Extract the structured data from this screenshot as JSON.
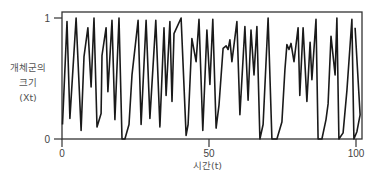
{
  "chart_data": {
    "type": "line",
    "title": "",
    "xlabel": "시간(t)",
    "ylabel": "개체군의 크기 (Xt)",
    "ylabel_lines": [
      "개체군의",
      "크기",
      "(Xt)"
    ],
    "xlim": [
      0,
      100
    ],
    "ylim": [
      0,
      1
    ],
    "x_ticks": [
      0,
      50,
      100
    ],
    "y_ticks": [
      0,
      1
    ],
    "grid": false,
    "legend": null,
    "series": [
      {
        "name": "Xt",
        "color": "#1a1a1a",
        "points": [
          [
            0,
            0.12
          ],
          [
            1.7,
            0.97
          ],
          [
            2.7,
            0.17
          ],
          [
            4.8,
            1.0
          ],
          [
            6.5,
            0.07
          ],
          [
            7.5,
            0.68
          ],
          [
            8.8,
            0.92
          ],
          [
            9.9,
            0.43
          ],
          [
            10.9,
            1.0
          ],
          [
            11.9,
            0.1
          ],
          [
            13.3,
            0.21
          ],
          [
            13.6,
            0.69
          ],
          [
            15.0,
            0.92
          ],
          [
            15.6,
            0.39
          ],
          [
            17.0,
            0.98
          ],
          [
            18.0,
            0.16
          ],
          [
            19.4,
            1.0
          ],
          [
            20.4,
            0.0
          ],
          [
            21.4,
            0.0
          ],
          [
            22.8,
            0.12
          ],
          [
            23.8,
            0.53
          ],
          [
            25.9,
            0.98
          ],
          [
            26.9,
            0.12
          ],
          [
            28.6,
            0.98
          ],
          [
            29.9,
            0.17
          ],
          [
            31.9,
            0.98
          ],
          [
            33.3,
            0.1
          ],
          [
            34.7,
            0.92
          ],
          [
            35.4,
            0.36
          ],
          [
            36.7,
            0.97
          ],
          [
            37.4,
            0.31
          ],
          [
            38.1,
            0.87
          ],
          [
            40.5,
            1.0
          ],
          [
            42.2,
            0.03
          ],
          [
            42.9,
            0.12
          ],
          [
            44.2,
            0.83
          ],
          [
            45.6,
            0.64
          ],
          [
            46.6,
            0.99
          ],
          [
            47.9,
            0.07
          ],
          [
            49.3,
            0.9
          ],
          [
            50.3,
            0.45
          ],
          [
            51.3,
            0.99
          ],
          [
            52.4,
            0.09
          ],
          [
            53.4,
            0.28
          ],
          [
            54.8,
            0.75
          ],
          [
            55.8,
            0.77
          ],
          [
            56.5,
            0.74
          ],
          [
            57.1,
            0.82
          ],
          [
            57.8,
            0.64
          ],
          [
            59.5,
            0.97
          ],
          [
            60.5,
            0.2
          ],
          [
            62.2,
            0.93
          ],
          [
            63.3,
            0.32
          ],
          [
            64.3,
            0.9
          ],
          [
            65.3,
            0.53
          ],
          [
            66.3,
            0.93
          ],
          [
            67.3,
            0.0
          ],
          [
            68.4,
            0.12
          ],
          [
            70.1,
            1.0
          ],
          [
            71.4,
            0.0
          ],
          [
            73.1,
            0.0
          ],
          [
            74.8,
            0.14
          ],
          [
            75.8,
            0.57
          ],
          [
            76.5,
            0.78
          ],
          [
            77.2,
            0.74
          ],
          [
            77.9,
            0.79
          ],
          [
            78.9,
            0.64
          ],
          [
            80.3,
            0.92
          ],
          [
            80.9,
            0.36
          ],
          [
            82.0,
            0.92
          ],
          [
            83.3,
            0.31
          ],
          [
            84.4,
            0.8
          ],
          [
            85.0,
            0.49
          ],
          [
            86.4,
            0.99
          ],
          [
            87.1,
            0.0
          ],
          [
            88.4,
            0.0
          ],
          [
            89.8,
            0.16
          ],
          [
            90.5,
            0.29
          ],
          [
            91.5,
            0.85
          ],
          [
            92.9,
            0.53
          ],
          [
            93.5,
            1.0
          ],
          [
            94.2,
            0.0
          ],
          [
            95.6,
            0.05
          ],
          [
            96.9,
            0.4
          ],
          [
            98.6,
            0.99
          ],
          [
            99.3,
            0.0
          ],
          [
            100.3,
            0.06
          ],
          [
            101.4,
            0.2
          ],
          [
            99.7,
            0.92
          ]
        ]
      }
    ]
  },
  "axes": {
    "x_tick_labels": [
      "0",
      "50",
      "100"
    ],
    "y_tick_labels": [
      "0",
      "1"
    ]
  }
}
